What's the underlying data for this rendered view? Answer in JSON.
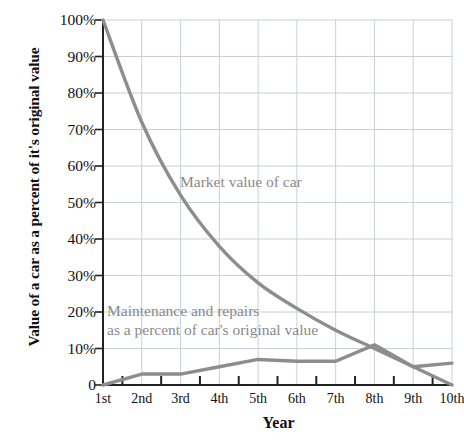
{
  "axes": {
    "y_title": "Value of a car as a percent of it's original value",
    "x_title": "Year",
    "y_ticks": [
      "100%",
      "90%",
      "80%",
      "70%",
      "60%",
      "50%",
      "40%",
      "30%",
      "20%",
      "10%",
      "0"
    ],
    "x_ticks": [
      "1st",
      "2nd",
      "3rd",
      "4th",
      "5th",
      "6th",
      "7th",
      "8th",
      "9th",
      "10th"
    ]
  },
  "annotations": {
    "market_label": "Market value of car",
    "maintenance_label_line1": "Maintenance and repairs",
    "maintenance_label_line2": "as a percent of car's original value"
  },
  "colors": {
    "line": "#8d8d8d",
    "grid": "#c9cfd6",
    "axis": "#222222",
    "label_text": "#8a8a8a",
    "background": "#ffffff"
  },
  "chart_data": {
    "type": "line",
    "title": "",
    "xlabel": "Year",
    "ylabel": "Value of a car as a percent of it's original value",
    "categories": [
      "1st",
      "2nd",
      "3rd",
      "4th",
      "5th",
      "6th",
      "7th",
      "8th",
      "9th",
      "10th"
    ],
    "ylim": [
      0,
      100
    ],
    "yticks": [
      0,
      10,
      20,
      30,
      40,
      50,
      60,
      70,
      80,
      90,
      100
    ],
    "grid": true,
    "legend": "inline-annotations",
    "series": [
      {
        "name": "Market value of car",
        "values": [
          100,
          72,
          52,
          38,
          28,
          21,
          15,
          10,
          5,
          0
        ]
      },
      {
        "name": "Maintenance and repairs as a percent of car's original value",
        "values": [
          0,
          3,
          3,
          5,
          7,
          6.5,
          6.5,
          11,
          5,
          6
        ]
      }
    ]
  }
}
